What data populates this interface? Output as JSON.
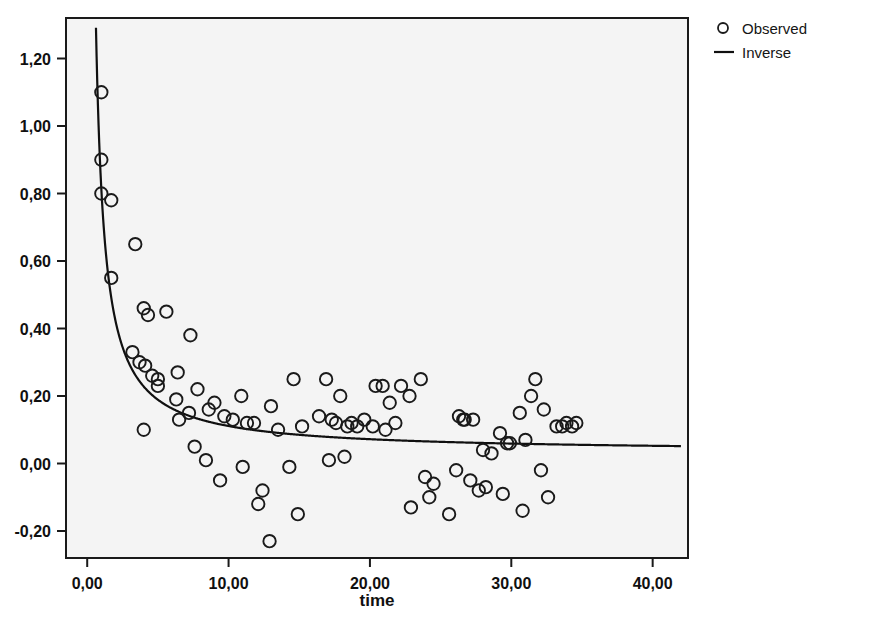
{
  "chart_data": {
    "type": "scatter",
    "title": "",
    "xlabel": "time",
    "ylabel": "",
    "xlim": [
      -1.5,
      42.5
    ],
    "ylim": [
      -0.28,
      1.32
    ],
    "grid": false,
    "legend_position": "top-right",
    "xticks": [
      0,
      10,
      20,
      30,
      40
    ],
    "xticklabels": [
      "0,00",
      "10,00",
      "20,00",
      "30,00",
      "40,00"
    ],
    "yticks": [
      -0.2,
      0.0,
      0.2,
      0.4,
      0.6,
      0.8,
      1.0,
      1.2
    ],
    "yticklabels": [
      "-0,20",
      "0,00",
      "0,20",
      "0,40",
      "0,60",
      "0,80",
      "1,00",
      "1,20"
    ],
    "legend": [
      {
        "label": "Observed",
        "marker": "circle-open",
        "type": "marker"
      },
      {
        "label": "Inverse",
        "marker": "line",
        "type": "line"
      }
    ],
    "series": [
      {
        "name": "Observed",
        "type": "scatter",
        "marker": "circle-open",
        "color": "#1a1a1a",
        "points": [
          [
            1.0,
            1.1
          ],
          [
            1.0,
            0.9
          ],
          [
            1.0,
            0.8
          ],
          [
            1.7,
            0.78
          ],
          [
            1.7,
            0.55
          ],
          [
            3.4,
            0.65
          ],
          [
            4.0,
            0.46
          ],
          [
            4.3,
            0.44
          ],
          [
            3.2,
            0.33
          ],
          [
            3.7,
            0.3
          ],
          [
            4.1,
            0.29
          ],
          [
            5.6,
            0.45
          ],
          [
            4.6,
            0.26
          ],
          [
            5.0,
            0.25
          ],
          [
            5.0,
            0.23
          ],
          [
            4.0,
            0.1
          ],
          [
            6.4,
            0.27
          ],
          [
            7.3,
            0.38
          ],
          [
            6.3,
            0.19
          ],
          [
            6.5,
            0.13
          ],
          [
            7.2,
            0.15
          ],
          [
            7.8,
            0.22
          ],
          [
            7.6,
            0.05
          ],
          [
            8.6,
            0.16
          ],
          [
            8.4,
            0.01
          ],
          [
            9.0,
            0.18
          ],
          [
            9.7,
            0.14
          ],
          [
            9.4,
            -0.05
          ],
          [
            10.3,
            0.13
          ],
          [
            10.9,
            0.2
          ],
          [
            11.3,
            0.12
          ],
          [
            11.0,
            -0.01
          ],
          [
            11.8,
            0.12
          ],
          [
            12.4,
            -0.08
          ],
          [
            12.1,
            -0.12
          ],
          [
            13.0,
            0.17
          ],
          [
            12.9,
            -0.23
          ],
          [
            13.5,
            0.1
          ],
          [
            14.6,
            0.25
          ],
          [
            14.3,
            -0.01
          ],
          [
            14.9,
            -0.15
          ],
          [
            15.2,
            0.11
          ],
          [
            16.4,
            0.14
          ],
          [
            16.9,
            0.25
          ],
          [
            17.3,
            0.13
          ],
          [
            17.6,
            0.12
          ],
          [
            17.9,
            0.2
          ],
          [
            17.1,
            0.01
          ],
          [
            18.4,
            0.11
          ],
          [
            18.7,
            0.12
          ],
          [
            18.2,
            0.02
          ],
          [
            19.1,
            0.11
          ],
          [
            19.6,
            0.13
          ],
          [
            20.4,
            0.23
          ],
          [
            20.9,
            0.23
          ],
          [
            20.2,
            0.11
          ],
          [
            21.4,
            0.18
          ],
          [
            21.1,
            0.1
          ],
          [
            21.8,
            0.12
          ],
          [
            22.2,
            0.23
          ],
          [
            22.8,
            0.2
          ],
          [
            22.9,
            -0.13
          ],
          [
            23.6,
            0.25
          ],
          [
            23.9,
            -0.04
          ],
          [
            24.5,
            -0.06
          ],
          [
            24.2,
            -0.1
          ],
          [
            25.6,
            -0.15
          ],
          [
            26.3,
            0.14
          ],
          [
            26.7,
            0.13
          ],
          [
            26.6,
            0.13
          ],
          [
            26.1,
            -0.02
          ],
          [
            27.3,
            0.13
          ],
          [
            27.1,
            -0.05
          ],
          [
            27.7,
            -0.08
          ],
          [
            28.2,
            -0.07
          ],
          [
            28.0,
            0.04
          ],
          [
            28.6,
            0.03
          ],
          [
            29.2,
            0.09
          ],
          [
            29.7,
            0.06
          ],
          [
            29.9,
            0.06
          ],
          [
            29.4,
            -0.09
          ],
          [
            30.6,
            0.15
          ],
          [
            31.0,
            0.07
          ],
          [
            31.4,
            0.2
          ],
          [
            31.7,
            0.25
          ],
          [
            30.8,
            -0.14
          ],
          [
            32.3,
            0.16
          ],
          [
            32.1,
            -0.02
          ],
          [
            32.6,
            -0.1
          ],
          [
            33.2,
            0.11
          ],
          [
            33.6,
            0.11
          ],
          [
            33.9,
            0.12
          ],
          [
            34.3,
            0.11
          ],
          [
            34.6,
            0.12
          ]
        ]
      },
      {
        "name": "Inverse",
        "type": "line",
        "color": "#101010",
        "model": "y = b0 + b1/x",
        "b0": 0.033,
        "b1": 0.78,
        "x_start": 0.62,
        "x_end": 42.0
      }
    ]
  }
}
